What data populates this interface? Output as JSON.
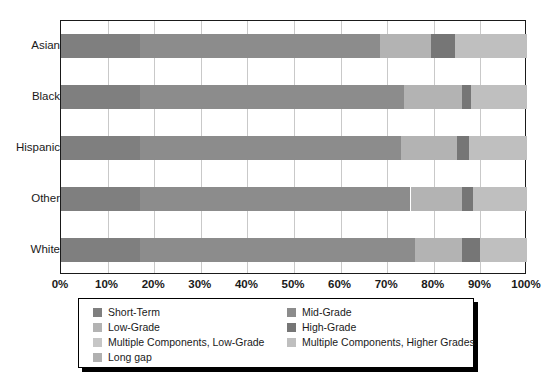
{
  "chart_data": {
    "type": "bar",
    "orientation": "horizontal",
    "stacked": true,
    "normalized": true,
    "title": "",
    "xlabel": "",
    "ylabel": "",
    "xlim": [
      0,
      100
    ],
    "xticks": [
      "0%",
      "10%",
      "20%",
      "30%",
      "40%",
      "50%",
      "60%",
      "70%",
      "80%",
      "90%",
      "100%"
    ],
    "xtick_values": [
      0,
      10,
      20,
      30,
      40,
      50,
      60,
      70,
      80,
      90,
      100
    ],
    "grid": true,
    "grid_axis": "x",
    "legend_position": "bottom",
    "categories": [
      "Asian",
      "Black",
      "Hispanic",
      "Other",
      "White"
    ],
    "series": [
      {
        "name": "Short-Term",
        "color": "#7f7f7f",
        "values": [
          17.0,
          17.0,
          17.0,
          17.0,
          17.0
        ]
      },
      {
        "name": "Mid-Grade",
        "color": "#8c8c8c",
        "values": [
          51.5,
          56.5,
          56.0,
          58.0,
          59.0
        ]
      },
      {
        "name": "Low-Grade",
        "color": "#b3b3b3",
        "values": [
          11.0,
          12.5,
          12.0,
          11.0,
          10.0
        ]
      },
      {
        "name": "High-Grade",
        "color": "#767676",
        "values": [
          5.0,
          2.0,
          2.5,
          2.5,
          4.0
        ]
      },
      {
        "name": "Multiple Components, Low-Grade",
        "color": "#c6c6c6",
        "values": [
          0.0,
          0.0,
          0.0,
          0.0,
          0.0
        ]
      },
      {
        "name": "Multiple Components, Higher Grades",
        "color": "#bfbfbf",
        "values": [
          15.5,
          12.0,
          12.5,
          11.5,
          10.0
        ]
      },
      {
        "name": "Long gap",
        "color": "#b0b0b0",
        "values": [
          0.0,
          0.0,
          0.0,
          0.0,
          0.0
        ]
      }
    ],
    "stacks": [
      {
        "category": "Asian",
        "segments": [
          {
            "name": "Short-Term",
            "start": 0.0,
            "end": 17.0,
            "color": "#7f7f7f"
          },
          {
            "name": "Mid-Grade",
            "start": 17.0,
            "end": 68.5,
            "color": "#8c8c8c"
          },
          {
            "name": "Low-Grade",
            "start": 68.5,
            "end": 79.5,
            "color": "#b3b3b3"
          },
          {
            "name": "High-Grade",
            "start": 79.5,
            "end": 84.5,
            "color": "#767676"
          },
          {
            "name": "Multiple Components, Higher Grades",
            "start": 84.5,
            "end": 100.0,
            "color": "#bfbfbf"
          }
        ]
      },
      {
        "category": "Black",
        "segments": [
          {
            "name": "Short-Term",
            "start": 0.0,
            "end": 17.0,
            "color": "#7f7f7f"
          },
          {
            "name": "Mid-Grade",
            "start": 17.0,
            "end": 73.5,
            "color": "#8c8c8c"
          },
          {
            "name": "Low-Grade",
            "start": 73.5,
            "end": 86.0,
            "color": "#b3b3b3"
          },
          {
            "name": "High-Grade",
            "start": 86.0,
            "end": 88.0,
            "color": "#767676"
          },
          {
            "name": "Multiple Components, Higher Grades",
            "start": 88.0,
            "end": 100.0,
            "color": "#bfbfbf"
          }
        ]
      },
      {
        "category": "Hispanic",
        "segments": [
          {
            "name": "Short-Term",
            "start": 0.0,
            "end": 17.0,
            "color": "#7f7f7f"
          },
          {
            "name": "Mid-Grade",
            "start": 17.0,
            "end": 73.0,
            "color": "#8c8c8c"
          },
          {
            "name": "Low-Grade",
            "start": 73.0,
            "end": 85.0,
            "color": "#b3b3b3"
          },
          {
            "name": "High-Grade",
            "start": 85.0,
            "end": 87.5,
            "color": "#767676"
          },
          {
            "name": "Multiple Components, Higher Grades",
            "start": 87.5,
            "end": 100.0,
            "color": "#bfbfbf"
          }
        ]
      },
      {
        "category": "Other",
        "segments": [
          {
            "name": "Short-Term",
            "start": 0.0,
            "end": 17.0,
            "color": "#7f7f7f"
          },
          {
            "name": "Mid-Grade",
            "start": 17.0,
            "end": 75.0,
            "color": "#8c8c8c"
          },
          {
            "name": "Low-Grade",
            "start": 75.0,
            "end": 86.0,
            "color": "#b3b3b3"
          },
          {
            "name": "High-Grade",
            "start": 86.0,
            "end": 88.5,
            "color": "#767676"
          },
          {
            "name": "Multiple Components, Higher Grades",
            "start": 88.5,
            "end": 100.0,
            "color": "#bfbfbf"
          }
        ]
      },
      {
        "category": "White",
        "segments": [
          {
            "name": "Short-Term",
            "start": 0.0,
            "end": 17.0,
            "color": "#7f7f7f"
          },
          {
            "name": "Mid-Grade",
            "start": 17.0,
            "end": 76.0,
            "color": "#8c8c8c"
          },
          {
            "name": "Low-Grade",
            "start": 76.0,
            "end": 86.0,
            "color": "#b3b3b3"
          },
          {
            "name": "High-Grade",
            "start": 86.0,
            "end": 90.0,
            "color": "#767676"
          },
          {
            "name": "Multiple Components, Higher Grades",
            "start": 90.0,
            "end": 100.0,
            "color": "#bfbfbf"
          }
        ]
      }
    ],
    "legend": [
      {
        "label": "Short-Term",
        "color": "#7f7f7f",
        "column": 0,
        "row": 0
      },
      {
        "label": "Low-Grade",
        "color": "#b3b3b3",
        "column": 0,
        "row": 1
      },
      {
        "label": "Multiple Components, Low-Grade",
        "color": "#c6c6c6",
        "column": 0,
        "row": 2
      },
      {
        "label": "Long gap",
        "color": "#b0b0b0",
        "column": 0,
        "row": 3
      },
      {
        "label": "Mid-Grade",
        "color": "#8c8c8c",
        "column": 1,
        "row": 0
      },
      {
        "label": "High-Grade",
        "color": "#767676",
        "column": 1,
        "row": 1
      },
      {
        "label": "Multiple Components, Higher Grades",
        "color": "#bfbfbf",
        "column": 1,
        "row": 2
      }
    ]
  },
  "style": {
    "axis_color": "#1a1a1a",
    "grid_color": "#c9c9c9",
    "legend_border_color": "#000000",
    "background": "#ffffff"
  }
}
